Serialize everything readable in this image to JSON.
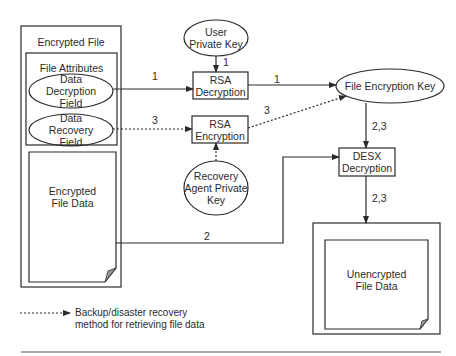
{
  "diagram": {
    "encrypted_file": {
      "title": "Encrypted File",
      "file_attributes": {
        "title": "File Attributes",
        "data_decryption_field": [
          "Data",
          "Decryption",
          "Field"
        ],
        "data_recovery_field": [
          "Data",
          "Recovery",
          "Field"
        ]
      },
      "encrypted_file_data": [
        "Encrypted",
        "File Data"
      ]
    },
    "user_private_key": [
      "User",
      "Private Key"
    ],
    "rsa_decryption": [
      "RSA",
      "Decryption"
    ],
    "rsa_encryption": [
      "RSA",
      "Encryption"
    ],
    "recovery_agent_private_key": [
      "Recovery",
      "Agent Private",
      "Key"
    ],
    "file_encryption_key": "File Encryption Key",
    "desx_decryption": [
      "DESX",
      "Decryption"
    ],
    "unencrypted_file_data": [
      "Unencrypted",
      "File Data"
    ],
    "edge_labels": {
      "ddf_to_rsa_dec": "1",
      "upk_to_rsa_dec": "1",
      "rsa_dec_to_fek": "1",
      "drf_to_rsa_enc": "3",
      "rsa_enc_to_fek": "3",
      "fek_to_desx": "2,3",
      "data_to_desx": "2",
      "desx_to_output": "2,3"
    },
    "legend": {
      "line_style": "dashed-arrow",
      "text": [
        "Backup/disaster recovery",
        "method for retrieving file data"
      ]
    },
    "colors": {
      "stroke": "#2a2a2a",
      "background": "#ffffff",
      "page_fold": "#9a9a9a"
    }
  }
}
